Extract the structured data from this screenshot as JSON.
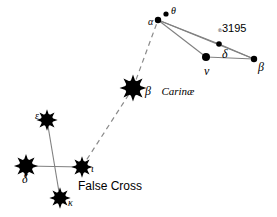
{
  "figure": {
    "width": 277,
    "height": 217,
    "background": "#ffffff",
    "ink_color": "#000000",
    "line_color": "#808080"
  },
  "chart_data": {
    "type": "scatter",
    "title": "",
    "xlabel": "",
    "ylabel": "",
    "xlim": [
      0,
      277
    ],
    "ylim": [
      0,
      217
    ],
    "grid": false,
    "legend": "none",
    "stars": [
      {
        "id": "epsilon-carinae",
        "label": "ε",
        "x": 47,
        "y": 120,
        "style": "spiked",
        "radius": 7.5,
        "label_dx": -12,
        "label_dy": -3,
        "label_size": "lbl-med"
      },
      {
        "id": "delta-velorum",
        "label": "δ",
        "x": 26,
        "y": 166,
        "style": "spiked",
        "radius": 8.5,
        "label_dx": -4,
        "label_dy": 13,
        "label_size": "lbl-big"
      },
      {
        "id": "kappa-velorum",
        "label": "κ",
        "x": 60,
        "y": 198,
        "style": "spiked",
        "radius": 7.5,
        "label_dx": 8,
        "label_dy": 6,
        "label_size": "lbl-med"
      },
      {
        "id": "iota-carinae",
        "label": "ι",
        "x": 82,
        "y": 167,
        "style": "spiked",
        "radius": 7.5,
        "label_dx": 9,
        "label_dy": 3,
        "label_size": "lbl-med"
      },
      {
        "id": "beta-carinae",
        "label": "",
        "x": 133,
        "y": 88,
        "style": "spiked",
        "radius": 9.5,
        "label_dx": 0,
        "label_dy": 0,
        "label_size": "lbl-med"
      },
      {
        "id": "alpha-volantis",
        "label": "α",
        "x": 158,
        "y": 20,
        "style": "dot",
        "radius": 3.2,
        "label_dx": -10,
        "label_dy": 3,
        "label_size": "lbl-med"
      },
      {
        "id": "theta-volantis",
        "label": "θ",
        "x": 166,
        "y": 14,
        "style": "dot",
        "radius": 2.6,
        "label_dx": 5,
        "label_dy": -2,
        "label_size": "lbl-med"
      },
      {
        "id": "delta-volantis",
        "label": "δ",
        "x": 219,
        "y": 44,
        "style": "dot",
        "radius": 2.8,
        "label_dx": 3,
        "label_dy": 10,
        "label_size": "lbl-big"
      },
      {
        "id": "nu-volantis",
        "label": "ν",
        "x": 206,
        "y": 57,
        "style": "dot",
        "radius": 4.0,
        "label_dx": -2,
        "label_dy": 14,
        "label_size": "lbl-big"
      },
      {
        "id": "beta-volantis",
        "label": "β",
        "x": 254,
        "y": 59,
        "style": "dot",
        "radius": 3.2,
        "label_dx": 4,
        "label_dy": 8,
        "label_size": "lbl-big"
      }
    ],
    "solid_lines": [
      {
        "id": "line-epsilon-kappa",
        "from": "epsilon-carinae",
        "to": "kappa-velorum"
      },
      {
        "id": "line-delta-iota",
        "from": "delta-velorum",
        "to": "iota-carinae"
      }
    ],
    "dashed_lines": [
      {
        "id": "line-iota-betacar",
        "from": "iota-carinae",
        "to": "beta-carinae"
      },
      {
        "id": "line-betacar-alpha",
        "from": "beta-carinae",
        "to": "alpha-volantis"
      }
    ],
    "volans_lines": [
      {
        "id": "line-alpha-nu",
        "from": "alpha-volantis",
        "to": "nu-volantis"
      },
      {
        "id": "line-alpha-delta",
        "from": "alpha-volantis",
        "to": "delta-volantis"
      },
      {
        "id": "line-alpha-beta",
        "from": "alpha-volantis",
        "to": "beta-volantis"
      },
      {
        "id": "line-nu-beta",
        "from": "nu-volantis",
        "to": "beta-volantis"
      },
      {
        "id": "line-delta-beta",
        "from": "delta-volantis",
        "to": "beta-volantis"
      }
    ]
  },
  "labels": {
    "beta_carinae_greek": "β",
    "beta_carinae_name": "Carinæ",
    "false_cross": "False Cross",
    "ngc_prefix": "℗",
    "ngc_number": "3195",
    "star_epsilon": "ε",
    "star_delta_velorum": "δ",
    "star_kappa": "κ",
    "star_iota": "ι",
    "star_alpha": "α",
    "star_theta": "θ",
    "star_delta_volantis": "δ",
    "star_nu": "ν",
    "star_beta_volantis": "β"
  }
}
